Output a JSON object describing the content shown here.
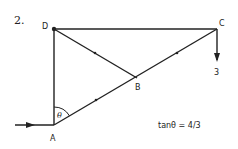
{
  "problem_number": "2.",
  "nodes": {
    "A": {
      "label": "A",
      "x": 54,
      "y": 125
    },
    "B": {
      "label": "B",
      "x": 137,
      "y": 78
    },
    "C": {
      "label": "C",
      "x": 217,
      "y": 29
    },
    "D": {
      "label": "D",
      "x": 54,
      "y": 29
    }
  },
  "members": [
    {
      "from": "D",
      "to": "C",
      "tick": false
    },
    {
      "from": "D",
      "to": "A",
      "tick": false
    },
    {
      "from": "D",
      "to": "B",
      "tick": true
    },
    {
      "from": "A",
      "to": "B",
      "tick": true
    },
    {
      "from": "B",
      "to": "C",
      "tick": true
    }
  ],
  "load": {
    "at": "C",
    "label": "3",
    "direction": "down"
  },
  "input_arrow": {
    "at": "A",
    "direction": "right"
  },
  "angle": {
    "at": "A",
    "symbol": "θ"
  },
  "equation": "tanθ = 4/3",
  "colors": {
    "line": "#222222",
    "background": "#ffffff"
  }
}
